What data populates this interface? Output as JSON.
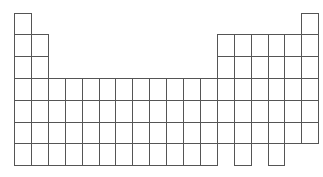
{
  "diagram": {
    "title": "",
    "line_color": "#555555",
    "grid": {
      "origin_x": 14,
      "origin_y": 12.5,
      "cell_width": 16.9,
      "cell_height": 21.8,
      "columns": 18,
      "rows": 7
    },
    "rows": [
      {
        "period": 1,
        "columns": [
          1,
          18
        ]
      },
      {
        "period": 2,
        "columns": [
          1,
          2,
          13,
          14,
          15,
          16,
          17,
          18
        ]
      },
      {
        "period": 3,
        "columns": [
          1,
          2,
          13,
          14,
          15,
          16,
          17,
          18
        ]
      },
      {
        "period": 4,
        "columns": [
          1,
          2,
          3,
          4,
          5,
          6,
          7,
          8,
          9,
          10,
          11,
          12,
          13,
          14,
          15,
          16,
          17,
          18
        ]
      },
      {
        "period": 5,
        "columns": [
          1,
          2,
          3,
          4,
          5,
          6,
          7,
          8,
          9,
          10,
          11,
          12,
          13,
          14,
          15,
          16,
          17,
          18
        ]
      },
      {
        "period": 6,
        "columns": [
          1,
          2,
          3,
          4,
          5,
          6,
          7,
          8,
          9,
          10,
          11,
          12,
          13,
          14,
          15,
          16,
          17,
          18
        ]
      },
      {
        "period": 7,
        "columns": [
          1,
          2,
          3,
          4,
          5,
          6,
          7,
          8,
          9,
          10,
          11,
          12,
          14,
          16
        ]
      }
    ]
  }
}
